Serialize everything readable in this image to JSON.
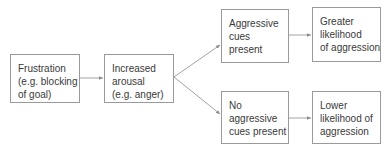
{
  "diagram": {
    "nodes": [
      {
        "id": "frustration",
        "lines": [
          "Frustration",
          "(e.g. blocking",
          "of goal)"
        ]
      },
      {
        "id": "arousal",
        "lines": [
          "Increased",
          "arousal",
          "(e.g. anger)"
        ]
      },
      {
        "id": "cues-present",
        "lines": [
          "Aggressive",
          "cues",
          "present"
        ]
      },
      {
        "id": "greater-likelihood",
        "lines": [
          "Greater",
          "likelihood",
          "of aggression"
        ]
      },
      {
        "id": "no-cues",
        "lines": [
          "No",
          "aggressive",
          "cues present"
        ]
      },
      {
        "id": "lower-likelihood",
        "lines": [
          "Lower",
          "likelihood of",
          "aggression"
        ]
      }
    ],
    "edges": [
      {
        "from": "frustration",
        "to": "arousal"
      },
      {
        "from": "arousal",
        "to": "cues-present"
      },
      {
        "from": "arousal",
        "to": "no-cues"
      },
      {
        "from": "cues-present",
        "to": "greater-likelihood"
      },
      {
        "from": "no-cues",
        "to": "lower-likelihood"
      }
    ],
    "colors": {
      "border": "#9a9a9a",
      "arrow": "#8a8a8a",
      "text": "#3a3a3a"
    }
  }
}
